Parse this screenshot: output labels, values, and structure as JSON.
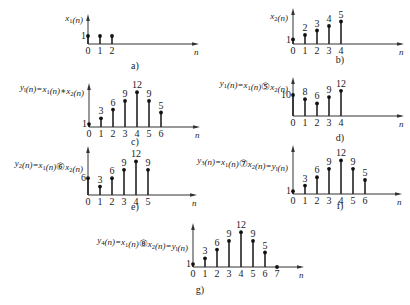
{
  "chart_data": [
    {
      "id": "a",
      "type": "stem",
      "caption": "a)",
      "ylabel": "x1(n)",
      "xlabel": "n",
      "x": [
        0,
        1,
        2
      ],
      "values": [
        1,
        1,
        1
      ],
      "value_labels": [
        "1",
        "",
        ""
      ],
      "axis_origin": [
        88,
        44
      ],
      "spacing": 12,
      "unit_px": 8
    },
    {
      "id": "b",
      "type": "stem",
      "caption": "b)",
      "ylabel": "x2(n)",
      "xlabel": "n",
      "x": [
        0,
        1,
        2,
        3,
        4
      ],
      "values": [
        1,
        2,
        3,
        4,
        5
      ],
      "value_labels": [
        "1",
        "2",
        "3",
        "4",
        "5"
      ],
      "axis_origin": [
        293,
        44
      ],
      "spacing": 12,
      "unit_px": 4.5
    },
    {
      "id": "c",
      "type": "stem",
      "caption": "c)",
      "ylabel": "y_l(n)=x1(n)*x2(n)",
      "xlabel": "n",
      "x": [
        0,
        1,
        2,
        3,
        4,
        5,
        6
      ],
      "values": [
        1,
        3,
        6,
        9,
        12,
        9,
        5
      ],
      "value_labels": [
        "1",
        "3",
        "6",
        "9",
        "12",
        "9",
        "5"
      ],
      "axis_origin": [
        89,
        127
      ],
      "spacing": 12,
      "unit_px": 2.9
    },
    {
      "id": "d",
      "type": "stem",
      "caption": "d)",
      "ylabel": "y1(n)=x1(n)⑤x2(n)",
      "xlabel": "n",
      "x": [
        0,
        1,
        2,
        3,
        4
      ],
      "values": [
        10,
        8,
        6,
        9,
        12
      ],
      "value_labels": [
        "10",
        "8",
        "6",
        "9",
        "12"
      ],
      "axis_origin": [
        293,
        116
      ],
      "spacing": 12,
      "unit_px": 2.1
    },
    {
      "id": "e",
      "type": "stem",
      "caption": "e)",
      "ylabel": "y2(n)=x1(n)⑥x2(n)",
      "xlabel": "n",
      "x": [
        0,
        1,
        2,
        3,
        4,
        5
      ],
      "values": [
        6,
        3,
        6,
        9,
        12,
        9
      ],
      "value_labels": [
        "6",
        "3",
        "6",
        "9",
        "12",
        "9"
      ],
      "axis_origin": [
        88,
        195
      ],
      "spacing": 12,
      "unit_px": 2.8
    },
    {
      "id": "f",
      "type": "stem",
      "caption": "f)",
      "ylabel": "y3(n)=x1(n)⑦x2(n)=y_l(n)",
      "xlabel": "n",
      "x": [
        0,
        1,
        2,
        3,
        4,
        5,
        6
      ],
      "values": [
        1,
        3,
        6,
        9,
        12,
        9,
        5
      ],
      "value_labels": [
        "1",
        "3",
        "6",
        "9",
        "12",
        "9",
        "5"
      ],
      "axis_origin": [
        293,
        194
      ],
      "spacing": 12,
      "unit_px": 2.8
    },
    {
      "id": "g",
      "type": "stem",
      "caption": "g)",
      "ylabel": "y4(n)=x1(n)⑧x2(n)=y_l(n)",
      "xlabel": "n",
      "x": [
        0,
        1,
        2,
        3,
        4,
        5,
        6,
        7
      ],
      "values": [
        1,
        3,
        6,
        9,
        12,
        9,
        5,
        0
      ],
      "value_labels": [
        "1",
        "3",
        "6",
        "9",
        "12",
        "9",
        "5",
        ""
      ],
      "axis_origin": [
        193,
        267
      ],
      "spacing": 12,
      "unit_px": 2.9
    }
  ],
  "panels": {
    "a": {
      "ylabel_main": "x",
      "ylabel_sub": "1",
      "ylabel_rest": "(n)",
      "caption": "a)",
      "ticks": [
        "0",
        "1",
        "2"
      ],
      "xlabel": "n"
    },
    "b": {
      "ylabel_main": "x",
      "ylabel_sub": "2",
      "ylabel_rest": "(n)",
      "caption": "b)",
      "ticks": [
        "0",
        "1",
        "2",
        "3",
        "4"
      ],
      "xlabel": "n"
    },
    "c": {
      "ylabel": "y_l(n)=x1(n)*x2(n)",
      "caption": "c)",
      "ticks": [
        "0",
        "1",
        "2",
        "3",
        "4",
        "5",
        "6"
      ],
      "xlabel": "n"
    },
    "d": {
      "ylabel": "y1(n)=x1(n)⑤x2(n)",
      "caption": "d)",
      "ticks": [
        "0",
        "1",
        "2",
        "3",
        "4"
      ],
      "xlabel": "n"
    },
    "e": {
      "ylabel": "y2(n)=x1(n)⑥x2(n)",
      "caption": "e)",
      "ticks": [
        "0",
        "1",
        "2",
        "3",
        "4",
        "5"
      ],
      "xlabel": "n"
    },
    "f": {
      "ylabel": "y3(n)=x1(n)⑦x2(n)=y_l(n)",
      "caption": "f)",
      "ticks": [
        "0",
        "1",
        "2",
        "3",
        "4",
        "5",
        "6"
      ],
      "xlabel": "n"
    },
    "g": {
      "ylabel": "y4(n)=x1(n)⑧x2(n)=y_l(n)",
      "caption": "g)",
      "ticks": [
        "0",
        "1",
        "2",
        "3",
        "4",
        "5",
        "6",
        "7"
      ],
      "xlabel": "n"
    }
  }
}
